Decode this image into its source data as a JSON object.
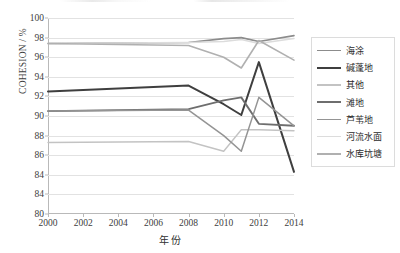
{
  "chart_data": {
    "type": "line",
    "title": "",
    "xlabel": "年份",
    "ylabel": "COHESION / %",
    "xlim": [
      2000,
      2014
    ],
    "ylim": [
      80,
      100
    ],
    "ytick_labels": [
      "100",
      "98",
      "96",
      "94",
      "92",
      "90",
      "88",
      "86",
      "84",
      "84",
      "80"
    ],
    "ytick_values": [
      100,
      98,
      96,
      94,
      92,
      90,
      88,
      86,
      84,
      82,
      80
    ],
    "xtick_labels": [
      "2000",
      "2002",
      "2004",
      "2006",
      "2008",
      "2010",
      "2012",
      "2014"
    ],
    "xtick_values": [
      2000,
      2002,
      2004,
      2006,
      2008,
      2010,
      2012,
      2014
    ],
    "grid": true,
    "legend_position": "right",
    "x": [
      2000,
      2008,
      2010,
      2011,
      2012,
      2014
    ],
    "series": [
      {
        "name": "海涂",
        "color": "#8c8c8c",
        "width": 1.6,
        "values": [
          97.4,
          97.5,
          97.9,
          98.0,
          97.6,
          98.2
        ]
      },
      {
        "name": "碱蓬地",
        "color": "#3f3f3f",
        "width": 2.0,
        "values": [
          92.5,
          93.1,
          91.2,
          90.1,
          95.5,
          84.3
        ]
      },
      {
        "name": "其他",
        "color": "#c3c3c3",
        "width": 1.4,
        "values": [
          87.3,
          87.4,
          86.4,
          88.6,
          88.6,
          88.5
        ]
      },
      {
        "name": "滩地",
        "color": "#6e6e6e",
        "width": 1.9,
        "values": [
          90.5,
          90.7,
          91.6,
          91.9,
          89.2,
          89.0
        ]
      },
      {
        "name": "芦苇地",
        "color": "#949494",
        "width": 1.5,
        "values": [
          90.5,
          90.6,
          88.0,
          86.4,
          91.9,
          89.0
        ]
      },
      {
        "name": "河流水面",
        "color": "#dcdcdc",
        "width": 1.5,
        "values": [
          97.4,
          97.5,
          97.6,
          97.8,
          97.4,
          97.9
        ]
      },
      {
        "name": "水库坑塘",
        "color": "#b0b0b0",
        "width": 1.6,
        "values": [
          97.4,
          97.2,
          96.0,
          94.9,
          97.7,
          95.7
        ]
      }
    ]
  }
}
